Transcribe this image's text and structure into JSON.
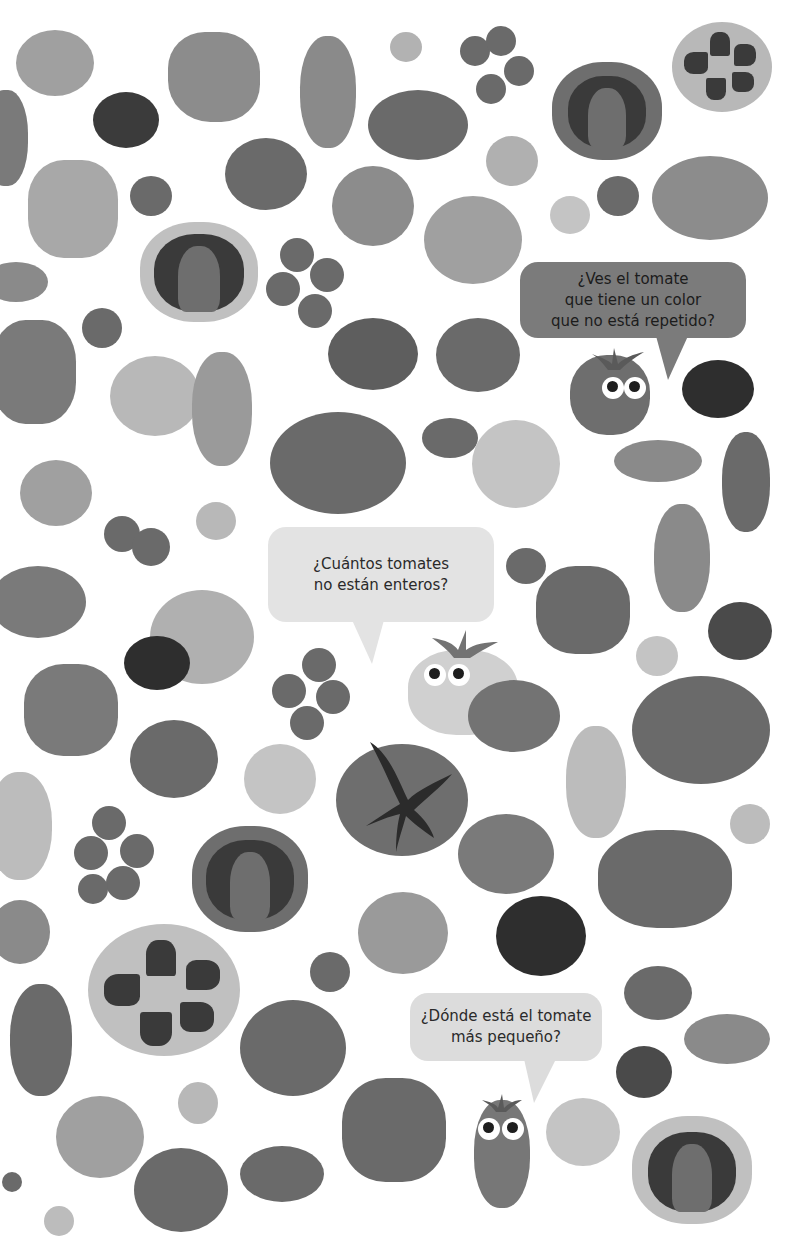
{
  "page": {
    "background": "#ffffff"
  },
  "bubbles": [
    {
      "id": "q-color",
      "lines": [
        "¿Ves el tomate",
        "que tiene un color",
        "que no está repetido?"
      ],
      "x": 520,
      "y": 262,
      "w": 226,
      "h": 76,
      "fill": "#7b7b7b",
      "text_color": "#1c1c1c"
    },
    {
      "id": "q-whole",
      "lines": [
        "¿Cuántos tomates",
        "no están enteros?"
      ],
      "x": 268,
      "y": 527,
      "w": 226,
      "h": 95,
      "fill": "#e3e3e3",
      "text_color": "#2a2a2a"
    },
    {
      "id": "q-smallest",
      "lines": [
        "¿Dónde está el tomate",
        "más pequeño?"
      ],
      "x": 410,
      "y": 993,
      "w": 192,
      "h": 68,
      "fill": "#dcdcdc",
      "text_color": "#2a2a2a"
    }
  ],
  "characters": [
    {
      "id": "char-top-right",
      "x": 570,
      "y": 355,
      "w": 80,
      "h": 80,
      "fill": "#6e6e6e"
    },
    {
      "id": "char-middle",
      "x": 408,
      "y": 650,
      "w": 110,
      "h": 85,
      "fill": "#d0d0d0"
    },
    {
      "id": "char-bottom",
      "x": 474,
      "y": 1100,
      "w": 56,
      "h": 108,
      "fill": "#777777"
    }
  ],
  "colors": {
    "light": "#bdbdbd",
    "mid_light": "#a6a6a6",
    "mid": "#8a8a8a",
    "mid_dark": "#737373",
    "dark": "#4a4a4a",
    "darkest": "#303030",
    "stem": "#5a5a5a"
  }
}
